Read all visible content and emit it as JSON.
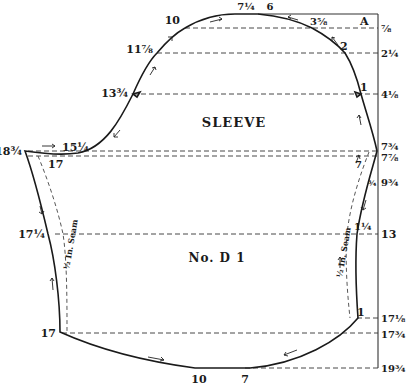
{
  "pattern": {
    "piece_title": "SLEEVE",
    "piece_number": "No. D 1",
    "corner_label": "A",
    "seam_label_left": "½ In. Seam",
    "seam_label_right": "½ In. Seam"
  },
  "right_scale": [
    {
      "label": "⅞",
      "y": 28
    },
    {
      "label": "2¼",
      "y": 53
    },
    {
      "label": "4⅛",
      "y": 94
    },
    {
      "label": "7¾",
      "y": 148
    },
    {
      "label": "7⅞",
      "y": 158
    },
    {
      "label": "9¾",
      "y": 182
    },
    {
      "label": "13",
      "y": 234
    },
    {
      "label": "17⅛",
      "y": 318
    },
    {
      "label": "17¾",
      "y": 334
    },
    {
      "label": "19¾",
      "y": 368
    }
  ],
  "cap_points": {
    "top_7_1_4": "7¼",
    "top_6": "6",
    "p10": "10",
    "p3_5_8": "3⅝",
    "p11_7_8": "11⅞",
    "p2": "2",
    "p13_3_4": "13¾",
    "p1": "1",
    "p15_1_4": "15¼",
    "p18_3_4": "18¾",
    "p17_top": "17",
    "p7_right": "7",
    "p3_4": "¾"
  },
  "body_points": {
    "p17_1_4": "17¼",
    "p1_1_4": "1¼",
    "p17_bottom": "17",
    "p1_bottom": "1",
    "p10_bottom": "10",
    "p7_bottom": "7"
  }
}
